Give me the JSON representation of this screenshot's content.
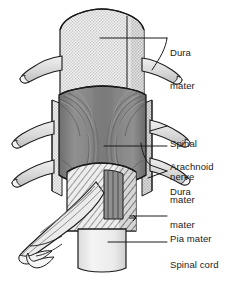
{
  "figure": {
    "background_color": "#ffffff",
    "line_color": "#1a1a1a"
  },
  "labels": [
    {
      "id": "dura-mater-top",
      "text": "Dura\nmater",
      "line1": "Dura",
      "line2": "mater",
      "x": 170,
      "y": 24
    },
    {
      "id": "spinal-nerve",
      "text": "Spinal\nnerve",
      "line1": "Spinal",
      "line2": "nerve",
      "x": 170,
      "y": 115
    },
    {
      "id": "arachnoid-mater",
      "text": "Arachnoid\nmater",
      "line1": "Arachnoid",
      "line2": "mater",
      "x": 170,
      "y": 138
    },
    {
      "id": "dura-mater-mid",
      "text": "Dura\nmater",
      "line1": "Dura",
      "line2": "mater",
      "x": 170,
      "y": 163
    },
    {
      "id": "pia-mater",
      "text": "Pia mater",
      "line1": "Pia mater",
      "line2": "",
      "x": 170,
      "y": 210
    },
    {
      "id": "spinal-cord",
      "text": "Spinal cord",
      "line1": "Spinal cord",
      "line2": "",
      "x": 170,
      "y": 236
    }
  ],
  "structures": {
    "dura_mater": {
      "name": "Dura mater",
      "fill": "#e6e6e6",
      "pattern": "stipple"
    },
    "arachnoid_mater": {
      "name": "Arachnoid mater",
      "fill": "#8d8d8d",
      "pattern": "striations"
    },
    "pia_mater": {
      "name": "Pia mater",
      "fill": "#e4e4e4",
      "pattern": "diagonal-hatch"
    },
    "spinal_cord": {
      "name": "Spinal cord",
      "fill": "#efefef",
      "pattern": "plain"
    },
    "spinal_nerve": {
      "name": "Spinal nerve",
      "fill": "#dcdcdc",
      "pattern": "plain"
    }
  },
  "colors": {
    "outline": "#1a1a1a",
    "dura_light": "#e8e8e8",
    "arachnoid_dark": "#8d8d8d",
    "arachnoid_shadow": "#6e6e6e",
    "nerve_fill": "#dddddd",
    "cord_fill": "#f0f0f0",
    "hatch_fill": "#e6e6e6"
  }
}
